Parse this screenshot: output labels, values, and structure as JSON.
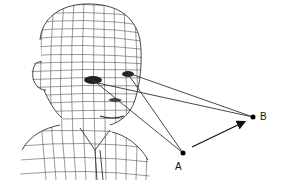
{
  "figure": {
    "points": [
      {
        "id": "A",
        "label": "A",
        "x": 183,
        "y": 153,
        "label_x": 175,
        "label_y": 162
      },
      {
        "id": "B",
        "label": "B",
        "x": 253,
        "y": 117,
        "label_x": 260,
        "label_y": 112
      }
    ],
    "eyes": [
      {
        "id": "left-eye",
        "x": 93,
        "y": 80
      },
      {
        "id": "right-eye",
        "x": 128,
        "y": 74
      }
    ],
    "arrow": {
      "from": "A",
      "to": "B"
    },
    "colors": {
      "line": "#333333",
      "mesh": "#555555",
      "point": "#000000",
      "background": "#ffffff"
    }
  }
}
